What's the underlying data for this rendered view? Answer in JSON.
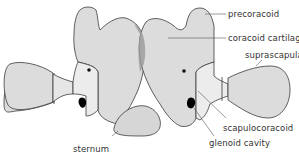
{
  "diagram": {
    "labels": {
      "precoracoid": "precoracoid",
      "coracoid_cartilage": "coracoid cartilage",
      "suprascapula": "suprascapula",
      "scapulocoracoid": "scapulocoracoid",
      "glenoid_cavity": "glenoid cavity",
      "sternum": "sternum"
    },
    "colors": {
      "bone_fill": "#dcdcdc",
      "cartilage_fill": "#cfcfcf",
      "overlap_shade": "#9a9a9a",
      "outline": "#3a3a3a",
      "cavity": "#000000",
      "leader_line": "#555555",
      "text": "#333333"
    }
  }
}
